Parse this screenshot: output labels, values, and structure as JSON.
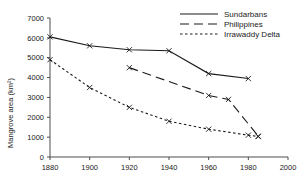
{
  "chart_data": {
    "type": "line",
    "title": "",
    "xlabel": "",
    "ylabel": "Mangrove area (km2)",
    "ylabel_display": "Mangrove area (km²)",
    "xlim": [
      1880,
      2000
    ],
    "ylim": [
      0,
      7000
    ],
    "xticks": [
      1880,
      1900,
      1920,
      1940,
      1960,
      1980,
      2000
    ],
    "yticks": [
      0,
      1000,
      2000,
      3000,
      4000,
      5000,
      6000,
      7000
    ],
    "grid": false,
    "legend_position": "top-right",
    "marker": "x",
    "series": [
      {
        "name": "Sundarbans",
        "linestyle": "solid",
        "color": "#1a1a1a",
        "x": [
          1880,
          1900,
          1920,
          1940,
          1960,
          1980
        ],
        "values": [
          6050,
          5600,
          5400,
          5350,
          4200,
          3950
        ]
      },
      {
        "name": "Philippines",
        "linestyle": "dashed",
        "color": "#1a1a1a",
        "x": [
          1920,
          1960,
          1970,
          1985
        ],
        "values": [
          4500,
          3100,
          2900,
          1050
        ]
      },
      {
        "name": "Irrawaddy Delta",
        "linestyle": "dotted",
        "color": "#1a1a1a",
        "x": [
          1880,
          1900,
          1920,
          1940,
          1960,
          1980,
          1985
        ],
        "values": [
          4900,
          3500,
          2500,
          1800,
          1400,
          1100,
          1030
        ]
      }
    ]
  },
  "legend": {
    "entries": [
      {
        "label": "Sundarbans"
      },
      {
        "label": "Philippines"
      },
      {
        "label": "Irrawaddy Delta"
      }
    ]
  },
  "axes": {
    "y_title": "Mangrove area (km²)",
    "x_tick_labels": [
      "1880",
      "1900",
      "1920",
      "1940",
      "1960",
      "1980",
      "2000"
    ],
    "y_tick_labels": [
      "0",
      "1000",
      "2000",
      "3000",
      "4000",
      "5000",
      "6000",
      "7000"
    ]
  }
}
